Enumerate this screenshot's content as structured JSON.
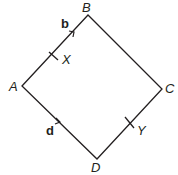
{
  "diagram": {
    "type": "geometry-parallelogram",
    "vertices": {
      "A": "A",
      "B": "B",
      "C": "C",
      "D": "D"
    },
    "points": {
      "X": "X",
      "Y": "Y"
    },
    "vectors": {
      "b": "b",
      "d": "d"
    },
    "line_color": "#231f20"
  }
}
